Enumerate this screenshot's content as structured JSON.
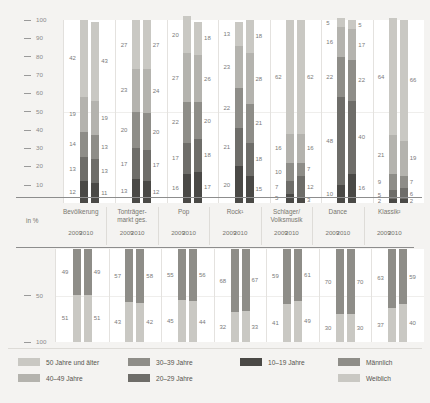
{
  "axis": {
    "unit_label": "in %",
    "top_ticks": [
      100,
      90,
      80,
      70,
      60,
      50,
      40,
      30,
      20,
      10
    ],
    "bottom_ticks": [
      50,
      100
    ]
  },
  "categories": [
    {
      "name": "Bevölkerung",
      "name_line2": ""
    },
    {
      "name": "Tonträger-",
      "name_line2": "markt ges."
    },
    {
      "name": "Pop",
      "name_line2": ""
    },
    {
      "name": "Rock¹",
      "name_line2": ""
    },
    {
      "name": "Schlager/",
      "name_line2": "Volksmusik"
    },
    {
      "name": "Dance",
      "name_line2": ""
    },
    {
      "name": "Klassik²",
      "name_line2": ""
    }
  ],
  "years": [
    "2009",
    "2010"
  ],
  "legend": [
    {
      "label": "50 Jahre und älter",
      "color": "#c9c8c3",
      "key": "c50"
    },
    {
      "label": "40–49 Jahre",
      "color": "#b4b3ae",
      "key": "c40"
    },
    {
      "label": "30–39 Jahre",
      "color": "#8e8d88",
      "key": "c30"
    },
    {
      "label": "20–29 Jahre",
      "color": "#6e6d69",
      "key": "c20"
    },
    {
      "label": "10–19 Jahre",
      "color": "#4a4946",
      "key": "c10"
    },
    {
      "label": "Männlich",
      "color": "#8e8d88",
      "key": "cm"
    },
    {
      "label": "Weiblich",
      "color": "#c9c8c3",
      "key": "cw"
    }
  ],
  "chart_data": [
    {
      "type": "bar",
      "title": "Altersstruktur",
      "xlabel": "",
      "ylabel": "in %",
      "ylim": [
        0,
        100
      ],
      "grid": true,
      "stacked": true,
      "legend_position": "bottom",
      "categories": [
        "Bevölkerung 2009",
        "Bevölkerung 2010",
        "Tonträgermarkt ges. 2009",
        "Tonträgermarkt ges. 2010",
        "Pop 2009",
        "Pop 2010",
        "Rock 2009",
        "Rock 2010",
        "Schlager/Volksmusik 2009",
        "Schlager/Volksmusik 2010",
        "Dance 2009",
        "Dance 2010",
        "Klassik 2009",
        "Klassik 2010"
      ],
      "series": [
        {
          "name": "10–19 Jahre",
          "values": [
            12,
            11,
            13,
            12,
            16,
            17,
            20,
            15,
            5,
            3,
            10,
            16,
            2,
            2
          ]
        },
        {
          "name": "20–29 Jahre",
          "values": [
            13,
            13,
            17,
            17,
            17,
            18,
            21,
            18,
            7,
            12,
            48,
            40,
            5,
            6
          ]
        },
        {
          "name": "30–39 Jahre",
          "values": [
            14,
            13,
            20,
            20,
            22,
            20,
            22,
            21,
            10,
            7,
            22,
            22,
            9,
            7
          ]
        },
        {
          "name": "40–49 Jahre",
          "values": [
            19,
            19,
            23,
            24,
            27,
            26,
            23,
            28,
            16,
            16,
            16,
            17,
            21,
            19
          ]
        },
        {
          "name": "50 Jahre und älter",
          "values": [
            42,
            43,
            27,
            27,
            20,
            18,
            13,
            18,
            62,
            62,
            5,
            5,
            64,
            66
          ]
        }
      ]
    },
    {
      "type": "bar",
      "title": "Geschlecht",
      "xlabel": "",
      "ylabel": "in %",
      "ylim": [
        0,
        100
      ],
      "grid": true,
      "stacked": true,
      "legend_position": "bottom",
      "categories": [
        "Bevölkerung 2009",
        "Bevölkerung 2010",
        "Tonträgermarkt ges. 2009",
        "Tonträgermarkt ges. 2010",
        "Pop 2009",
        "Pop 2010",
        "Rock 2009",
        "Rock 2010",
        "Schlager/Volksmusik 2009",
        "Schlager/Volksmusik 2010",
        "Dance 2009",
        "Dance 2010",
        "Klassik 2009",
        "Klassik 2010"
      ],
      "series": [
        {
          "name": "Männlich",
          "values": [
            49,
            49,
            57,
            58,
            55,
            56,
            68,
            67,
            59,
            61,
            70,
            70,
            63,
            59
          ]
        },
        {
          "name": "Weiblich",
          "values": [
            51,
            51,
            43,
            42,
            45,
            44,
            32,
            33,
            41,
            49,
            30,
            30,
            37,
            40
          ]
        }
      ]
    }
  ]
}
